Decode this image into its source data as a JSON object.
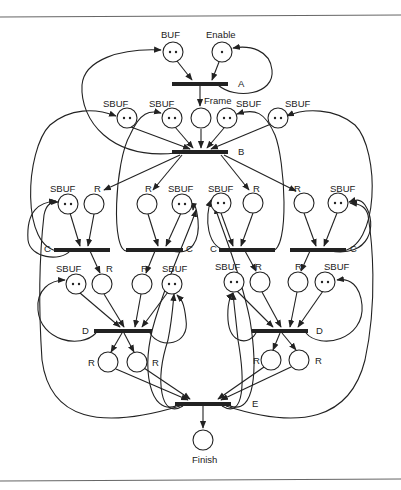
{
  "diagram": {
    "type": "petri-net",
    "places": {
      "buf": {
        "label": "BUF",
        "tokens": 2
      },
      "enable": {
        "label": "Enable",
        "tokens": 1
      },
      "frame": {
        "label": "Frame",
        "tokens": 0
      },
      "sbuf_b1": {
        "label": "SBUF",
        "tokens": 2
      },
      "sbuf_b2": {
        "label": "SBUF",
        "tokens": 2
      },
      "sbuf_b3": {
        "label": "SBUF",
        "tokens": 2
      },
      "sbuf_b4": {
        "label": "SBUF",
        "tokens": 2
      },
      "c_sbuf1": {
        "label": "SBUF",
        "tokens": 2
      },
      "c_r1": {
        "label": "R",
        "tokens": 0
      },
      "c_r2": {
        "label": "R",
        "tokens": 0
      },
      "c_sbuf2": {
        "label": "SBUF",
        "tokens": 2
      },
      "c_sbuf3": {
        "label": "SBUF",
        "tokens": 2
      },
      "c_r3": {
        "label": "R",
        "tokens": 0
      },
      "c_r4": {
        "label": "R",
        "tokens": 0
      },
      "c_sbuf4": {
        "label": "SBUF",
        "tokens": 2
      },
      "d_sbuf1": {
        "label": "SBUF",
        "tokens": 2
      },
      "d_r1": {
        "label": "R",
        "tokens": 0
      },
      "d_r2": {
        "label": "R",
        "tokens": 0
      },
      "d_sbuf2": {
        "label": "SBUF",
        "tokens": 2
      },
      "d_sbuf3": {
        "label": "SBUF",
        "tokens": 2
      },
      "d_r3": {
        "label": "R",
        "tokens": 0
      },
      "d_r4": {
        "label": "R",
        "tokens": 0
      },
      "d_sbuf4": {
        "label": "SBUF",
        "tokens": 2
      },
      "e_r1": {
        "label": "R",
        "tokens": 0
      },
      "e_r2": {
        "label": "R",
        "tokens": 0
      },
      "e_r3": {
        "label": "R",
        "tokens": 0
      },
      "e_r4": {
        "label": "R",
        "tokens": 0
      },
      "finish": {
        "label": "Finish",
        "tokens": 0
      }
    },
    "transitions": {
      "a": {
        "label": "A"
      },
      "b": {
        "label": "B"
      },
      "c1": {
        "label": "C"
      },
      "c2": {
        "label": "C"
      },
      "c3": {
        "label": "C"
      },
      "c4": {
        "label": "C"
      },
      "d1": {
        "label": "D"
      },
      "d2": {
        "label": "D"
      },
      "e": {
        "label": "E"
      }
    }
  }
}
